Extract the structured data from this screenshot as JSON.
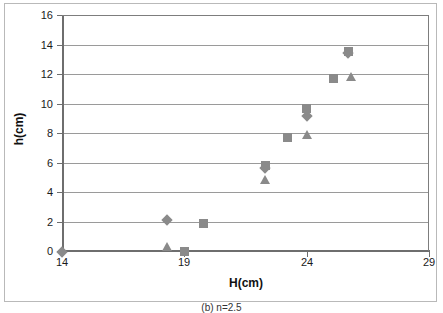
{
  "figure": {
    "caption": "(b) n=2.5"
  },
  "chart_data": {
    "type": "scatter",
    "title": "",
    "xlabel": "H(cm)",
    "ylabel": "h(cm)",
    "xlim": [
      14,
      29
    ],
    "ylim": [
      0,
      16
    ],
    "xticks": [
      14,
      19,
      24,
      29
    ],
    "yticks": [
      0,
      2,
      4,
      6,
      8,
      10,
      12,
      14,
      16
    ],
    "grid": "horizontal",
    "legend": "none",
    "marker_color": "#8a8a8a",
    "series": [
      {
        "name": "series-diamond",
        "marker": "diamond",
        "points": [
          {
            "x": 14.0,
            "y": 0.0
          },
          {
            "x": 18.3,
            "y": 2.2
          },
          {
            "x": 22.3,
            "y": 5.7
          },
          {
            "x": 24.0,
            "y": 9.2
          },
          {
            "x": 25.7,
            "y": 13.5
          }
        ]
      },
      {
        "name": "series-square",
        "marker": "square",
        "points": [
          {
            "x": 19.0,
            "y": 0.05
          },
          {
            "x": 19.8,
            "y": 1.95
          },
          {
            "x": 22.3,
            "y": 5.85
          },
          {
            "x": 23.2,
            "y": 7.75
          },
          {
            "x": 24.0,
            "y": 9.75
          },
          {
            "x": 25.1,
            "y": 11.75
          },
          {
            "x": 25.7,
            "y": 13.6
          }
        ]
      },
      {
        "name": "series-triangle",
        "marker": "triangle",
        "points": [
          {
            "x": 18.3,
            "y": 0.4
          },
          {
            "x": 22.3,
            "y": 4.9
          },
          {
            "x": 24.0,
            "y": 7.95
          },
          {
            "x": 25.8,
            "y": 11.9
          }
        ]
      }
    ]
  }
}
